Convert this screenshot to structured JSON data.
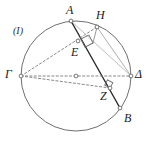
{
  "figure": {
    "caption": "(I)",
    "background": "#ffffff",
    "stroke_circle": "#6f6f6f",
    "stroke_solid": "#2a2a2a",
    "stroke_dashed": "#7a7a7a",
    "stroke_light": "#b0b0b0",
    "point_marker_fill": "#ffffff",
    "point_marker_stroke": "#555555",
    "width": 152,
    "height": 146,
    "circle": {
      "cx": 76,
      "cy": 76,
      "r": 55
    },
    "points": [
      {
        "id": "A",
        "label": "A",
        "x": 71,
        "y": 21,
        "label_x": 66,
        "label_y": 4,
        "marker": true
      },
      {
        "id": "H",
        "label": "H",
        "x": 97,
        "y": 27,
        "label_x": 96,
        "label_y": 9,
        "marker": true
      },
      {
        "id": "Gamma",
        "label": "Γ",
        "x": 21,
        "y": 76,
        "label_x": 5,
        "label_y": 68,
        "marker": true
      },
      {
        "id": "Delta",
        "label": "Δ",
        "x": 131,
        "y": 76,
        "label_x": 135,
        "label_y": 68,
        "marker": true
      },
      {
        "id": "E",
        "label": "E",
        "x": 78,
        "y": 41,
        "label_x": 71,
        "label_y": 46,
        "marker": true
      },
      {
        "id": "Z",
        "label": "Z",
        "x": 110,
        "y": 88,
        "label_x": 100,
        "label_y": 90,
        "marker": true
      },
      {
        "id": "B",
        "label": "B",
        "x": 120,
        "y": 108,
        "label_x": 124,
        "label_y": 112,
        "marker": true
      },
      {
        "id": "O",
        "label": "",
        "x": 76,
        "y": 76,
        "label_x": 0,
        "label_y": 0,
        "marker": true
      },
      {
        "id": "Theta",
        "label": "",
        "x": 93,
        "y": 43,
        "label_x": 0,
        "label_y": 0,
        "marker": false
      }
    ],
    "segments": [
      {
        "id": "chord-A-B",
        "from": "A",
        "to": "B",
        "style": "solid",
        "color": "#2a2a2a",
        "width": 1.4
      },
      {
        "id": "diameter-Gamma-Delta",
        "from": "Gamma",
        "to": "Delta",
        "style": "dashed",
        "color": "#7a7a7a",
        "width": 0.9
      },
      {
        "id": "line-Gamma-H",
        "from": "Gamma",
        "to": "H",
        "style": "dashed",
        "color": "#7a7a7a",
        "width": 0.9
      },
      {
        "id": "line-Gamma-Z",
        "from": "Gamma",
        "to": "Z",
        "style": "dashed",
        "color": "#7a7a7a",
        "width": 0.9
      },
      {
        "id": "line-H-Delta",
        "from": "H",
        "to": "Delta",
        "style": "solid",
        "color": "#b0b0b0",
        "width": 1.0
      },
      {
        "id": "line-A-Delta",
        "from": "A",
        "to": "Delta",
        "style": "solid",
        "color": "#b8b8b8",
        "width": 0.9
      },
      {
        "id": "perp-H-Theta",
        "from": "H",
        "to": "Theta",
        "style": "solid",
        "color": "#9a9a9a",
        "width": 1.0
      }
    ],
    "right_angles": [
      {
        "id": "right-angle-at-theta",
        "x": 93,
        "y": 43,
        "size": 9,
        "rot": -27,
        "color": "#6b6b6b"
      },
      {
        "id": "right-angle-at-z",
        "x": 110,
        "y": 88,
        "size": 6,
        "rot": 28,
        "color": "#6b6b6b"
      }
    ]
  }
}
